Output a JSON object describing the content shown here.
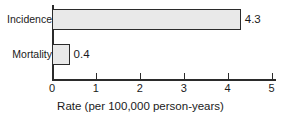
{
  "chart_data": {
    "type": "bar",
    "orientation": "horizontal",
    "title": "",
    "xlabel": "Rate (per 100,000 person-years)",
    "ylabel": "",
    "categories": [
      "Incidence",
      "Mortality"
    ],
    "values": [
      4.3,
      0.4
    ],
    "value_labels": [
      "4.3",
      "0.4"
    ],
    "xlim": [
      0,
      5
    ],
    "xticks": [
      0,
      1,
      2,
      3,
      4,
      5
    ],
    "xtick_labels": [
      "0",
      "1",
      "2",
      "3",
      "4",
      "5"
    ],
    "grid": false,
    "legend": null,
    "bar_fill_color": "#e9e9e9",
    "bar_edge_color": "#2b2b2b",
    "axis_color": "#2b2b2b",
    "background_color": "#ffffff"
  }
}
